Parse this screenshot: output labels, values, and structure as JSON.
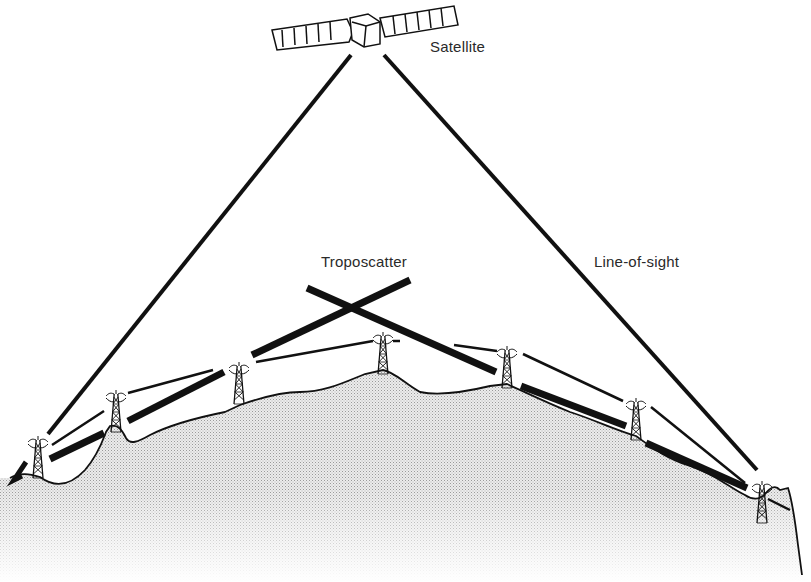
{
  "diagram": {
    "labels": {
      "satellite": "Satellite",
      "troposcatter": "Troposcatter",
      "line_of_sight": "Line-of-sight"
    },
    "nodes": [
      {
        "id": "satellite",
        "type": "satellite",
        "x": 362,
        "y": 33
      },
      {
        "id": "tower-1",
        "type": "relay-tower",
        "x": 38,
        "y": 466
      },
      {
        "id": "tower-2",
        "type": "relay-tower",
        "x": 116,
        "y": 410
      },
      {
        "id": "tower-3",
        "type": "relay-tower",
        "x": 239,
        "y": 378
      },
      {
        "id": "tower-4",
        "type": "relay-tower",
        "x": 383,
        "y": 350
      },
      {
        "id": "tower-5",
        "type": "relay-tower",
        "x": 507,
        "y": 365
      },
      {
        "id": "tower-6",
        "type": "relay-tower",
        "x": 636,
        "y": 418
      },
      {
        "id": "tower-7",
        "type": "relay-tower",
        "x": 762,
        "y": 498
      }
    ],
    "links": [
      {
        "type": "satellite",
        "from": "tower-1",
        "to": "satellite"
      },
      {
        "type": "satellite",
        "from": "satellite",
        "to": "tower-7"
      },
      {
        "type": "line-of-sight",
        "path": [
          "tower-1",
          "tower-2",
          "tower-3",
          "tower-4",
          "tower-5",
          "tower-6",
          "tower-7"
        ]
      },
      {
        "type": "troposcatter",
        "path": [
          "tower-1",
          "tower-3",
          "scatter-point",
          "tower-5",
          "tower-7"
        ]
      }
    ],
    "colors": {
      "ink": "#111111",
      "terrain_fill": "#d9d9d9",
      "label_text": "#2a2a2a"
    }
  }
}
